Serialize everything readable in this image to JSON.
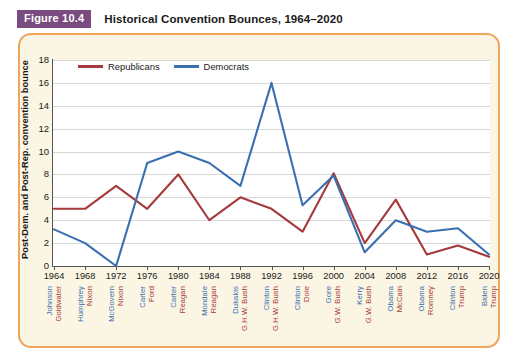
{
  "figure": {
    "badge": "Figure 10.4",
    "title": "Historical Convention Bounces, 1964–2020",
    "badge_color": "#7a4b7f",
    "border_color": "#f0a45e",
    "panel_background": "#fbf5e4",
    "plot_background": "#ffffff"
  },
  "legend": {
    "position": "top-left-inside",
    "items": [
      {
        "label": "Republicans",
        "color": "#a63a3a"
      },
      {
        "label": "Democrats",
        "color": "#3a6fb0"
      }
    ]
  },
  "axes": {
    "ylabel": "Post-Dem. and Post-Rep. convention bounce",
    "yticks": [
      18,
      16,
      14,
      12,
      10,
      8,
      6,
      4,
      2,
      0
    ],
    "ylim": [
      0,
      18
    ],
    "xlabel": "",
    "grid": true
  },
  "candidates": [
    {
      "year": "1964",
      "democrat": "Johnson",
      "republican": "Goldwater"
    },
    {
      "year": "1968",
      "democrat": "Humphrey",
      "republican": "Nixon"
    },
    {
      "year": "1972",
      "democrat": "McGovern",
      "republican": "Nixon"
    },
    {
      "year": "1976",
      "democrat": "Carter",
      "republican": "Ford"
    },
    {
      "year": "1980",
      "democrat": "Carter",
      "republican": "Reagan"
    },
    {
      "year": "1984",
      "democrat": "Mondale",
      "republican": "Reagan"
    },
    {
      "year": "1988",
      "democrat": "Dukakis",
      "republican": "G.H.W. Bush"
    },
    {
      "year": "1992",
      "democrat": "Clinton",
      "republican": "G.H.W. Bush"
    },
    {
      "year": "1996",
      "democrat": "Clinton",
      "republican": "Dole"
    },
    {
      "year": "2000",
      "democrat": "Gore",
      "republican": "G.W. Bush"
    },
    {
      "year": "2004",
      "democrat": "Kerry",
      "republican": "G.W. Bush"
    },
    {
      "year": "2008",
      "democrat": "Obama",
      "republican": "McCain"
    },
    {
      "year": "2012",
      "democrat": "Obama",
      "republican": "Romney"
    },
    {
      "year": "2016",
      "democrat": "Clinton",
      "republican": "Trump"
    },
    {
      "year": "2020",
      "democrat": "Biden",
      "republican": "Trump"
    }
  ],
  "chart_data": {
    "type": "line",
    "title": "Historical Convention Bounces, 1964–2020",
    "xlabel": "",
    "ylabel": "Post-Dem. and Post-Rep. convention bounce",
    "ylim": [
      0,
      18
    ],
    "ytick_step": 2,
    "grid": true,
    "legend_position": "upper-left",
    "categories": [
      "1964",
      "1968",
      "1972",
      "1976",
      "1980",
      "1984",
      "1988",
      "1992",
      "1996",
      "2000",
      "2004",
      "2008",
      "2012",
      "2016",
      "2020"
    ],
    "series": [
      {
        "name": "Republicans",
        "color": "#a63a3a",
        "values": [
          5,
          5,
          7,
          5,
          8,
          4,
          6,
          5,
          3,
          8.1,
          2,
          5.8,
          1,
          1.8,
          0.8
        ]
      },
      {
        "name": "Democrats",
        "color": "#3a6fb0",
        "values": [
          3.2,
          2,
          0,
          9,
          10,
          9,
          7,
          16,
          5.3,
          7.9,
          1.2,
          4,
          3,
          3.3,
          1
        ]
      }
    ]
  }
}
